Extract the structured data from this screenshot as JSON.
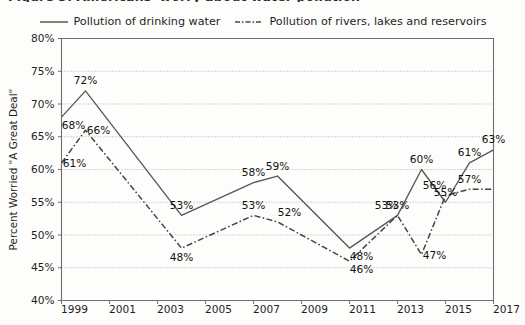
{
  "figure": {
    "title": "Figure 3. Americans' worry about water pollution"
  },
  "chart_data": {
    "type": "line",
    "title": "Figure 3. Americans' worry about water pollution",
    "xlabel": "",
    "ylabel": "Percent Worried \"A Great Deal\"",
    "xlim": [
      1999,
      2017
    ],
    "ylim": [
      40,
      80
    ],
    "ytick_step": 5,
    "ytick_labels": [
      "80%",
      "75%",
      "70%",
      "65%",
      "60%",
      "55%",
      "50%",
      "45%",
      "40%"
    ],
    "ytick_values": [
      80,
      75,
      70,
      65,
      60,
      55,
      50,
      45,
      40
    ],
    "xtick_labels": [
      "1999",
      "2001",
      "2003",
      "2005",
      "2007",
      "2009",
      "2011",
      "2013",
      "2015",
      "2017"
    ],
    "xtick_values": [
      1999,
      2001,
      2003,
      2005,
      2007,
      2009,
      2011,
      2013,
      2015,
      2017
    ],
    "grid": "horizontal-dotted",
    "legend_position": "top-center",
    "series": [
      {
        "name": "Pollution of drinking water",
        "style": "solid",
        "color": "#585858",
        "x": [
          1999,
          2000,
          2004,
          2007,
          2008,
          2011,
          2013,
          2014,
          2015,
          2016,
          2017
        ],
        "values": [
          68,
          72,
          53,
          58,
          59,
          48,
          53,
          60,
          55,
          61,
          63
        ],
        "labels": [
          "68%",
          "72%",
          "53%",
          "58%",
          "59%",
          "48%",
          "53%",
          "60%",
          "55%",
          "61%",
          "63%"
        ],
        "label_positions": [
          "below-left",
          "above",
          "above",
          "above",
          "above",
          "below-right",
          "above-left",
          "above",
          "above",
          "above",
          "above"
        ]
      },
      {
        "name": "Pollution of rivers, lakes and reservoirs",
        "style": "dash-dot",
        "color": "#444444",
        "x": [
          1999,
          2000,
          2004,
          2007,
          2008,
          2011,
          2013,
          2014,
          2015,
          2016,
          2017
        ],
        "values": [
          61,
          66,
          48,
          53,
          52,
          46,
          53,
          47,
          56,
          57,
          57
        ],
        "labels": [
          "61%",
          "66%",
          "48%",
          "53%",
          "52%",
          "46%",
          "53%",
          "47%",
          "56%",
          "57%",
          ""
        ],
        "label_positions": [
          "right",
          "right",
          "below",
          "above",
          "above-right",
          "below-right",
          "above",
          "right",
          "above-left",
          "above"
        ]
      }
    ]
  },
  "legend": {
    "items": [
      {
        "label": "Pollution of drinking water",
        "style": "solid"
      },
      {
        "label": "Pollution of rivers, lakes and reservoirs",
        "style": "dash-dot"
      }
    ]
  }
}
